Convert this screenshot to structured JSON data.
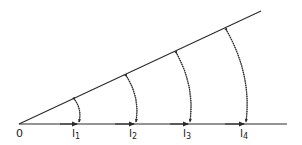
{
  "diagram": {
    "type": "geometric construction",
    "origin_label": "0",
    "points": [
      {
        "label": "l",
        "subscript": "1"
      },
      {
        "label": "l",
        "subscript": "2"
      },
      {
        "label": "l",
        "subscript": "3"
      },
      {
        "label": "l",
        "subscript": "4"
      }
    ],
    "colors": {
      "line": "#2a2a2a",
      "background": "#ffffff"
    }
  }
}
